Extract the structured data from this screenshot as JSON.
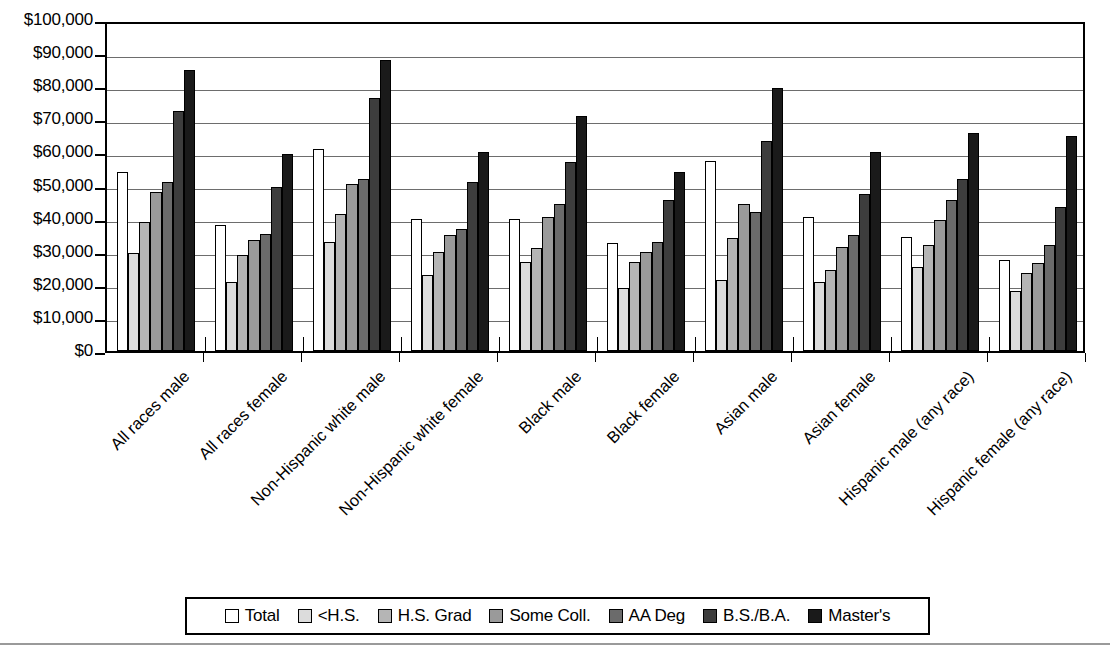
{
  "chart_data": {
    "type": "bar",
    "title": "",
    "xlabel": "",
    "ylabel": "",
    "ylim": [
      0,
      100000
    ],
    "grid": true,
    "legend_position": "bottom",
    "ytick_labels": [
      "$100,000",
      "$90,000",
      "$80,000",
      "$70,000",
      "$60,000",
      "$50,000",
      "$40,000",
      "$30,000",
      "$20,000",
      "$10,000",
      "$0"
    ],
    "ytick_values": [
      100000,
      90000,
      80000,
      70000,
      60000,
      50000,
      40000,
      30000,
      20000,
      10000,
      0
    ],
    "categories": [
      "All races male",
      "All races female",
      "Non-Hispanic white male",
      "Non-Hispanic white female",
      "Black male",
      "Black female",
      "Asian male",
      "Asian female",
      "Hispanic male (any race)",
      "Hispanic female (any race)"
    ],
    "series": [
      {
        "name": "Total",
        "color": "#ffffff",
        "values": [
          54000,
          38000,
          61000,
          40000,
          40000,
          32500,
          57500,
          40500,
          34500,
          27500
        ]
      },
      {
        "name": "<H.S.",
        "color": "#dcdcdc",
        "values": [
          29500,
          21000,
          33000,
          23000,
          27000,
          19000,
          21500,
          21000,
          25500,
          18000
        ]
      },
      {
        "name": "H.S. Grad",
        "color": "#b5b5b5",
        "values": [
          39000,
          29000,
          41500,
          30000,
          31000,
          27000,
          34000,
          24500,
          32000,
          23500
        ]
      },
      {
        "name": "Some Coll.",
        "color": "#9a9a9a",
        "values": [
          48000,
          33500,
          50500,
          35000,
          40500,
          30000,
          44500,
          31500,
          39500,
          26500
        ]
      },
      {
        "name": "AA Deg",
        "color": "#6b6b6b",
        "values": [
          51000,
          35500,
          52000,
          37000,
          44500,
          33000,
          42000,
          35000,
          45500,
          32000
        ]
      },
      {
        "name": "B.S./B.A.",
        "color": "#3d3d3d",
        "values": [
          72500,
          49500,
          76500,
          51000,
          57000,
          45500,
          63500,
          47500,
          52000,
          43500
        ]
      },
      {
        "name": "Master's",
        "color": "#1a1a1a",
        "values": [
          85000,
          59500,
          88000,
          60000,
          71000,
          54000,
          79500,
          60000,
          66000,
          65000
        ]
      }
    ]
  },
  "legend": {
    "items": [
      {
        "label": "Total"
      },
      {
        "label": "<H.S."
      },
      {
        "label": "H.S. Grad"
      },
      {
        "label": "Some Coll."
      },
      {
        "label": "AA Deg"
      },
      {
        "label": "B.S./B.A."
      },
      {
        "label": "Master's"
      }
    ]
  }
}
